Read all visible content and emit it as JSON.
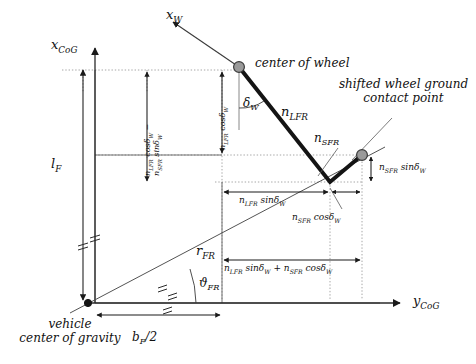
{
  "figure": {
    "kind": "kinematic-diagram"
  },
  "axes": {
    "x_cog": "x",
    "x_cog_sub": "CoG",
    "y_cog": "y",
    "y_cog_sub": "CoG",
    "x_wheel": "x",
    "x_wheel_sub": "W"
  },
  "annotations": {
    "center_of_wheel": "center of wheel",
    "shifted_point_line1": "shifted wheel ground",
    "shifted_point_line2": "contact point",
    "vehicle_cog_line1": "vehicle",
    "vehicle_cog_line2": "center of gravity"
  },
  "symbols": {
    "delta_w": "δ",
    "delta_w_sub": "W",
    "n_lfr": "n",
    "n_lfr_sub": "LFR",
    "n_sfr": "n",
    "n_sfr_sub": "SFR",
    "l_f": "l",
    "l_f_sub": "F",
    "r_fr": "r",
    "r_fr_sub": "FR",
    "theta_fr": "ϑ",
    "theta_fr_sub": "FR",
    "b_f_half": "b",
    "b_f_half_sub": "F",
    "b_f_half_tail": "/2"
  },
  "dimensions": {
    "vert_diff": "n_LFR cosδ_W − n_SFR sinδ_W",
    "vert_diff_a": "n",
    "vert_diff_a_sub": "LFR",
    "vert_diff_a_fn": " cosδ",
    "vert_diff_a_fn_sub": "W",
    "vert_diff_minus": " −",
    "vert_diff_b": "n",
    "vert_diff_b_sub": "SFR",
    "vert_diff_b_fn": " sinδ",
    "vert_diff_b_fn_sub": "W",
    "n_lfr_cos": "n_LFR cosδ_W",
    "n_sfr_sin": "n_SFR sinδ_W",
    "n_lfr_sin": "n_LFR sinδ_W",
    "n_sfr_cos": "n_SFR cosδ_W",
    "sum_label": "n_LFR sinδ_W + n_SFR cosδ_W"
  },
  "colors": {
    "ink": "#1a1a1a",
    "thin": "#4a4a4a",
    "dotted": "#8c8c8c",
    "node_fill": "#9a9a9a",
    "node_stroke": "#3a3a3a",
    "background": "#ffffff"
  },
  "geometry": {
    "origin": {
      "x": 88,
      "y": 303
    },
    "wheel_center": {
      "x": 239,
      "y": 67
    },
    "contact_point": {
      "x": 362,
      "y": 155
    },
    "linkage_vertex": {
      "x": 330,
      "y": 182
    }
  }
}
